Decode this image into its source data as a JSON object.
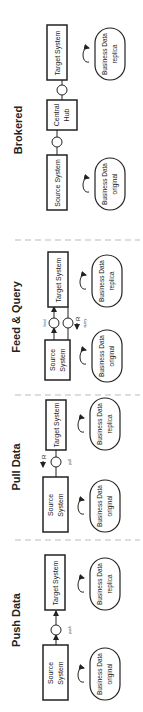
{
  "sections": [
    {
      "title": "Push Data",
      "source": [
        "Source",
        "System"
      ],
      "target": [
        "Target System"
      ],
      "connectors": [
        {
          "label": "push"
        }
      ],
      "source_data": [
        "Business Data",
        "original"
      ],
      "target_data": [
        "Business Data",
        "replica"
      ]
    },
    {
      "title": "Pull Data",
      "source": [
        "Source",
        "System"
      ],
      "target": [
        "Target System"
      ],
      "connectors": [
        {
          "label": "pull",
          "marker": "R"
        }
      ],
      "source_data": [
        "Business Data",
        "original"
      ],
      "target_data": [
        "Business Data",
        "replica"
      ]
    },
    {
      "title": "Feed & Query",
      "source": [
        "Source",
        "System"
      ],
      "target": [
        "Target System"
      ],
      "connectors": [
        {
          "label": "feed"
        },
        {
          "label": "query",
          "marker": "R"
        }
      ],
      "source_data": [
        "Business Data",
        "original"
      ],
      "target_data": [
        "Business Data",
        "replica"
      ]
    },
    {
      "title": "Brokered",
      "source": [
        "Source System"
      ],
      "hub": [
        "Central",
        "Hub"
      ],
      "target": [
        "Target System"
      ],
      "source_data": [
        "Business Data",
        "original"
      ],
      "target_data": [
        "Business Data",
        "replica"
      ]
    }
  ],
  "colors": {
    "stroke": "#222222",
    "divider": "#bbbbbb",
    "text": "#222222"
  }
}
